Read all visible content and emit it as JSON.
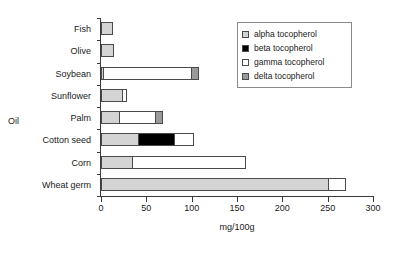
{
  "chart_data": {
    "type": "bar",
    "orientation": "horizontal",
    "stacked": true,
    "title": "",
    "xlabel": "mg/100g",
    "ylabel": "Oil",
    "xlim": [
      0,
      300
    ],
    "xticks": [
      0,
      50,
      100,
      150,
      200,
      250,
      300
    ],
    "xtick_labels": [
      "0",
      "50",
      "100",
      "150",
      "200",
      "250",
      "300"
    ],
    "grid": false,
    "legend_position": "top-right",
    "categories": [
      "Fish",
      "Olive",
      "Soybean",
      "Sunflower",
      "Palm",
      "Cotton seed",
      "Corn",
      "Wheat germ"
    ],
    "series": [
      {
        "name": "alpha tocopherol",
        "color": "#d4d4d4",
        "values": [
          13,
          14,
          3,
          24,
          21,
          42,
          35,
          252
        ]
      },
      {
        "name": "beta tocopherol",
        "color": "#000000",
        "values": [
          0,
          0,
          0,
          0,
          0,
          41,
          0,
          0
        ]
      },
      {
        "name": "gamma tocopherol",
        "color": "#ffffff",
        "values": [
          0,
          0,
          98,
          6,
          41,
          22,
          126,
          19
        ]
      },
      {
        "name": "delta tocopherol",
        "color": "#9a9a9a",
        "values": [
          0,
          0,
          9,
          0,
          9,
          0,
          0,
          0
        ]
      }
    ],
    "totals": [
      13,
      14,
      110,
      30,
      71,
      105,
      161,
      271
    ]
  },
  "legend": {
    "items": [
      {
        "label": "alpha tocopherol",
        "swatch_class": "sw-alpha"
      },
      {
        "label": "beta tocopherol",
        "swatch_class": "sw-beta"
      },
      {
        "label": "gamma tocopherol",
        "swatch_class": "sw-gamma"
      },
      {
        "label": "delta tocopherol",
        "swatch_class": "sw-delta"
      }
    ]
  },
  "axes": {
    "x_title": "mg/100g",
    "y_title": "Oil"
  }
}
